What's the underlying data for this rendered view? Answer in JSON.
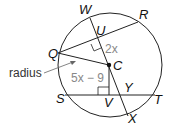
{
  "diagram": {
    "points": {
      "W": "W",
      "R": "R",
      "U": "U",
      "Q": "Q",
      "C": "C",
      "S": "S",
      "V": "V",
      "Y": "Y",
      "T": "T",
      "X": "X"
    },
    "expressions": {
      "CU": "2x",
      "CV": "5x − 9"
    },
    "annotation": "radius",
    "colors": {
      "stroke": "#222222",
      "expression": "#888888",
      "arrow": "#666666"
    }
  }
}
